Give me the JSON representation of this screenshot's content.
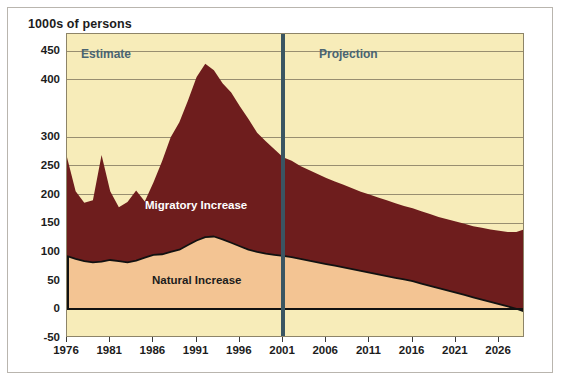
{
  "figure": {
    "title": "1000s of persons",
    "background": "#ffffff",
    "frame_color": "#b9b5ae"
  },
  "annotations": {
    "estimate_label": "Estimate",
    "projection_label": "Projection",
    "divider_year": 2001,
    "period_label_color": "#4a6472",
    "divider_color": "#3a5562"
  },
  "colors": {
    "plot_background": "#f7ecb9",
    "migratory": "#6e1d1d",
    "natural": "#f3c493",
    "gridline": "#8d8468",
    "axis": "#1c1c1c"
  },
  "chart_data": {
    "type": "area",
    "title": "1000s of persons",
    "xlabel": "",
    "ylabel": "1000s of persons",
    "stacked": true,
    "grid": true,
    "legend_position": "inline-labels",
    "xlim": [
      1976,
      2029
    ],
    "ylim": [
      -50,
      480
    ],
    "yticks": [
      -50,
      0,
      50,
      100,
      150,
      200,
      250,
      300,
      400,
      450
    ],
    "ytick_labels": [
      "-50",
      "0",
      "50",
      "100",
      "150",
      "200",
      "250",
      "300",
      "400",
      "450"
    ],
    "xticks": [
      1976,
      1981,
      1986,
      1991,
      1996,
      2001,
      2006,
      2011,
      2016,
      2021,
      2026
    ],
    "xtick_labels": [
      "1976",
      "1981",
      "1986",
      "1991",
      "1996",
      "2001",
      "2006",
      "2011",
      "2016",
      "2021",
      "2026"
    ],
    "x": [
      1976,
      1977,
      1978,
      1979,
      1980,
      1981,
      1982,
      1983,
      1984,
      1985,
      1986,
      1987,
      1988,
      1989,
      1990,
      1991,
      1992,
      1993,
      1994,
      1995,
      1996,
      1997,
      1998,
      1999,
      2000,
      2001,
      2002,
      2003,
      2004,
      2005,
      2006,
      2007,
      2008,
      2009,
      2010,
      2011,
      2012,
      2013,
      2014,
      2015,
      2016,
      2017,
      2018,
      2019,
      2020,
      2021,
      2022,
      2023,
      2024,
      2025,
      2026,
      2027,
      2028,
      2029
    ],
    "series": [
      {
        "name": "Natural Increase",
        "color": "#f3c493",
        "values": [
          93,
          88,
          84,
          82,
          83,
          86,
          84,
          82,
          85,
          90,
          95,
          96,
          100,
          104,
          112,
          120,
          126,
          127,
          122,
          116,
          110,
          104,
          100,
          97,
          95,
          93,
          91,
          88,
          85,
          82,
          79,
          76,
          73,
          70,
          67,
          64,
          61,
          58,
          55,
          52,
          49,
          45,
          41,
          37,
          33,
          29,
          25,
          21,
          17,
          13,
          9,
          5,
          1,
          -4
        ]
      },
      {
        "name": "Migratory Increase",
        "color": "#6e1d1d",
        "values": [
          172,
          118,
          102,
          108,
          186,
          120,
          94,
          105,
          122,
          98,
          126,
          162,
          200,
          222,
          252,
          285,
          302,
          290,
          272,
          262,
          244,
          228,
          208,
          196,
          184,
          172,
          168,
          162,
          158,
          154,
          150,
          147,
          144,
          141,
          138,
          136,
          134,
          132,
          130,
          128,
          127,
          126,
          125,
          124,
          124,
          124,
          124,
          124,
          125,
          126,
          128,
          130,
          134,
          144
        ]
      }
    ],
    "totals": [
      265,
      206,
      186,
      190,
      269,
      206,
      178,
      187,
      207,
      188,
      221,
      258,
      300,
      326,
      364,
      405,
      428,
      417,
      394,
      378,
      354,
      332,
      308,
      293,
      279,
      265,
      259,
      250,
      243,
      236,
      229,
      223,
      217,
      211,
      205,
      200,
      195,
      190,
      185,
      180,
      176,
      171,
      166,
      161,
      157,
      153,
      149,
      145,
      142,
      139,
      137,
      135,
      135,
      140
    ]
  }
}
